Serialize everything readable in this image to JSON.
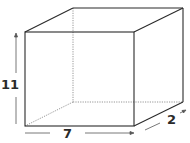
{
  "diagram": {
    "type": "rectangular-prism",
    "colors": {
      "line": "#2a2a2a",
      "hidden_line": "#8a8a8a",
      "background": "#ffffff"
    },
    "dimensions": {
      "height": {
        "label": "11"
      },
      "width": {
        "label": "7"
      },
      "depth": {
        "label": "2"
      }
    }
  }
}
